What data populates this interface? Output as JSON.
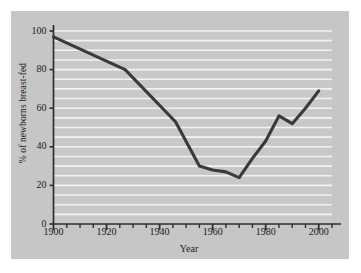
{
  "chart_data": {
    "type": "line",
    "title": "",
    "xlabel": "Year",
    "ylabel": "% of newborns breast-fed",
    "xlim": [
      1900,
      2005
    ],
    "ylim": [
      0,
      100
    ],
    "grid": true,
    "legend_position": "none",
    "x_ticks_major": [
      1900,
      1920,
      1940,
      1960,
      1980,
      2000
    ],
    "x_tick_labels": [
      "1900",
      "1920",
      "1940",
      "1960",
      "1980",
      "2000"
    ],
    "x_ticks_minor_step": 5,
    "y_ticks": [
      0,
      20,
      40,
      60,
      80,
      100
    ],
    "y_tick_labels": [
      "0",
      "20",
      "40",
      "60",
      "80",
      "100"
    ],
    "y_gridline_step": 5,
    "series": [
      {
        "name": "% of newborns breast-fed",
        "color": "#3a3a3a",
        "x": [
          1900,
          1927,
          1946,
          1955,
          1960,
          1965,
          1970,
          1975,
          1980,
          1985,
          1990,
          1995,
          2000
        ],
        "values": [
          97,
          80,
          53,
          30,
          28,
          27,
          24,
          34,
          43,
          56,
          52,
          60,
          69
        ]
      }
    ]
  },
  "colors": {
    "panel_background": "#c6c6c6",
    "plot_background": "#c8c8c8",
    "gridline": "#f2f2f2",
    "axis": "#2e2e2e",
    "line": "#3a3a3a",
    "text": "#1a1a1a"
  }
}
